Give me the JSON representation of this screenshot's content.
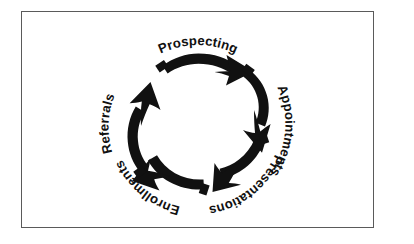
{
  "figure": {
    "kind": "cycle-diagram",
    "title": "",
    "frame_border_color": "#5a5a5a",
    "background_color": "#ffffff",
    "arrow_color": "#111111",
    "direction": "clockwise",
    "center": {
      "x": 198,
      "y": 122
    },
    "radius": 67,
    "stages": [
      {
        "id": "prospecting",
        "label": "Prospecting",
        "order": 1,
        "arc_start_deg": -122,
        "arc_end_deg": -40,
        "label_path_id": "labelPathProspecting",
        "label_offset_percent": 50
      },
      {
        "id": "appointments",
        "label": "Appointments",
        "order": 2,
        "arc_start_deg": -34,
        "arc_end_deg": 42,
        "label_path_id": "labelPathAppointments",
        "label_offset_percent": 50
      },
      {
        "id": "presentations",
        "label": "Presentations",
        "order": 3,
        "arc_start_deg": 48,
        "arc_end_deg": 124,
        "label_path_id": "labelPathPresentations",
        "label_offset_percent": 50
      },
      {
        "id": "enrollments",
        "label": "Enrollments",
        "order": 4,
        "arc_start_deg": 130,
        "arc_end_deg": 206,
        "label_path_id": "labelPathEnrollments",
        "label_offset_percent": 50
      },
      {
        "id": "referrals",
        "label": "Referrals",
        "order": 5,
        "arc_start_deg": 212,
        "arc_end_deg": 290,
        "label_path_id": "labelPathReferrals",
        "label_offset_percent": 50
      }
    ]
  }
}
